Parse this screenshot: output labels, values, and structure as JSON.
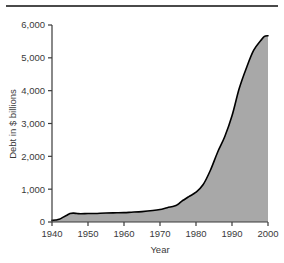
{
  "chart_data": {
    "type": "area",
    "title": "",
    "xlabel": "Year",
    "ylabel": "Debt in $ billions",
    "xlim": [
      1940,
      2000
    ],
    "ylim": [
      0,
      6000
    ],
    "xticks": [
      1940,
      1950,
      1960,
      1970,
      1980,
      1990,
      2000
    ],
    "xtick_labels": [
      "1940",
      "1950",
      "1960",
      "1970",
      "1980",
      "1990",
      "2000"
    ],
    "yticks": [
      0,
      1000,
      2000,
      3000,
      4000,
      5000,
      6000
    ],
    "ytick_labels": [
      "0",
      "1,000",
      "2,000",
      "3,000",
      "4,000",
      "5,000",
      "6,000"
    ],
    "grid": false,
    "legend": "none",
    "series": [
      {
        "name": "National debt",
        "fill_color": "#a8a8a8",
        "line_color": "#000000",
        "x": [
          1940,
          1941,
          1942,
          1943,
          1944,
          1945,
          1946,
          1947,
          1948,
          1950,
          1952,
          1955,
          1958,
          1960,
          1962,
          1965,
          1968,
          1970,
          1972,
          1974,
          1975,
          1976,
          1978,
          1980,
          1982,
          1984,
          1986,
          1988,
          1990,
          1992,
          1994,
          1996,
          1998,
          1999,
          2000
        ],
        "y": [
          50,
          60,
          80,
          140,
          200,
          260,
          270,
          258,
          252,
          257,
          259,
          274,
          280,
          286,
          298,
          317,
          348,
          381,
          436,
          484,
          541,
          629,
          772,
          908,
          1142,
          1577,
          2125,
          2602,
          3233,
          4065,
          4693,
          5225,
          5526,
          5656,
          5674
        ]
      }
    ]
  },
  "axis": {
    "y_title": "Debt in $ billions",
    "x_title": "Year"
  }
}
